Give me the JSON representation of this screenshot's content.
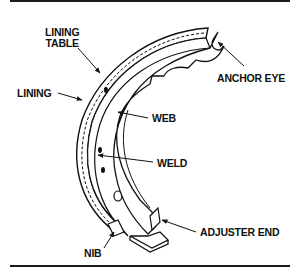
{
  "diagram": {
    "labels": {
      "lining_table_line1": "LINING",
      "lining_table_line2": "TABLE",
      "lining": "LINING",
      "anchor_eye": "ANCHOR EYE",
      "web": "WEB",
      "weld": "WELD",
      "adjuster_end": "ADJUSTER END",
      "nib": "NIB"
    }
  }
}
